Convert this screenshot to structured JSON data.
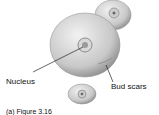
{
  "diagram": {
    "labels": {
      "nucleus": "Nucleus",
      "bud_scars": "Bud scars"
    },
    "caption": "(a) Figure 3.16"
  }
}
